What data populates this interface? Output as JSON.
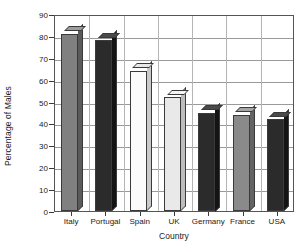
{
  "chart_data": {
    "type": "bar",
    "title": "",
    "xlabel": "Country",
    "ylabel": "Percentage of Males",
    "categories": [
      "Italy",
      "Portugal",
      "Spain",
      "UK",
      "Germany",
      "France",
      "USA"
    ],
    "values": [
      81,
      78,
      64,
      52,
      45,
      44,
      42
    ],
    "ylim": [
      0,
      90
    ],
    "ytick_step": 10,
    "yticks": [
      0,
      10,
      20,
      30,
      40,
      50,
      60,
      70,
      80,
      90
    ],
    "ytick_labels": [
      "0",
      "10",
      "20",
      "30",
      "40",
      "50",
      "60",
      "70",
      "80",
      "90"
    ],
    "grid": "horizontal",
    "legend": "none",
    "bar_style": "3d-extruded",
    "series": [
      {
        "name": "Percentage of Males",
        "points": [
          {
            "category": "Italy",
            "value": 81,
            "face_color": "#808080",
            "side_color": "#5a5a5a",
            "top_color": "#9d9d9d"
          },
          {
            "category": "Portugal",
            "value": 78,
            "face_color": "#2b2b2b",
            "side_color": "#141414",
            "top_color": "#4a4a4a"
          },
          {
            "category": "Spain",
            "value": 64,
            "face_color": "#fbfbfb",
            "side_color": "#c9c9c9",
            "top_color": "#e8e8e8"
          },
          {
            "category": "UK",
            "value": 52,
            "face_color": "#e9e9e9",
            "side_color": "#bdbdbd",
            "top_color": "#f4f4f4"
          },
          {
            "category": "Germany",
            "value": 45,
            "face_color": "#2b2b2b",
            "side_color": "#141414",
            "top_color": "#4a4a4a"
          },
          {
            "category": "France",
            "value": 44,
            "face_color": "#8a8a8a",
            "side_color": "#636363",
            "top_color": "#a6a6a6"
          },
          {
            "category": "USA",
            "value": 42,
            "face_color": "#2b2b2b",
            "side_color": "#141414",
            "top_color": "#4a4a4a"
          }
        ]
      }
    ],
    "colors": {
      "axis": "#555555",
      "gridline": "#9a9a9a",
      "separator": "#b5b5b5",
      "text": "#1a1a1a",
      "background": "#ffffff"
    }
  }
}
